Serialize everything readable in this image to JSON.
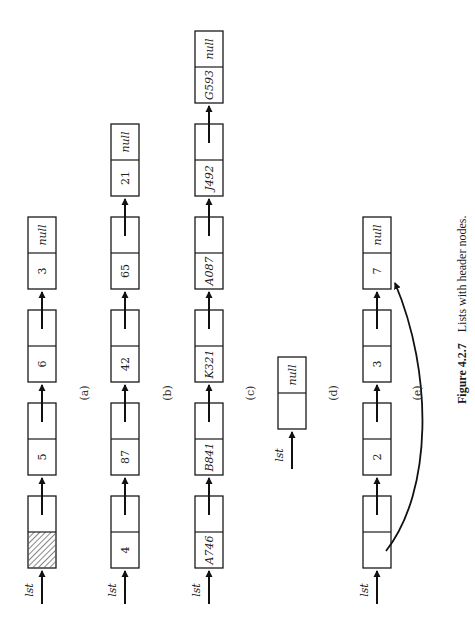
{
  "figure": {
    "caption_number": "Figure 4.2.7",
    "caption_text": "Lists with header nodes.",
    "orientation": "rotated-90-ccw"
  },
  "lists": [
    {
      "id": "a",
      "label": "(a)",
      "pointer_name": "lst",
      "header": "hatched",
      "nodes": [
        {
          "info": "",
          "next": "",
          "hatched": true
        },
        {
          "info": "5",
          "next": ""
        },
        {
          "info": "6",
          "next": ""
        },
        {
          "info": "3",
          "next": "null"
        }
      ]
    },
    {
      "id": "b",
      "label": "(b)",
      "pointer_name": "lst",
      "header": "count",
      "nodes": [
        {
          "info": "4",
          "next": ""
        },
        {
          "info": "87",
          "next": ""
        },
        {
          "info": "42",
          "next": ""
        },
        {
          "info": "65",
          "next": ""
        },
        {
          "info": "21",
          "next": "null"
        }
      ]
    },
    {
      "id": "c",
      "label": "(c)",
      "pointer_name": "lst",
      "header": "last-node-id",
      "nodes": [
        {
          "info": "A746",
          "next": ""
        },
        {
          "info": "B841",
          "next": ""
        },
        {
          "info": "K321",
          "next": ""
        },
        {
          "info": "A087",
          "next": ""
        },
        {
          "info": "J492",
          "next": ""
        },
        {
          "info": "G593",
          "next": "null"
        }
      ]
    },
    {
      "id": "d",
      "label": "(d)",
      "pointer_name": "lst",
      "header": "empty",
      "nodes": [
        {
          "info": "",
          "next": "null"
        }
      ]
    },
    {
      "id": "e",
      "label": "(e)",
      "pointer_name": "lst",
      "header": "pointer-to-last",
      "header_points_to_index": 3,
      "nodes": [
        {
          "info": "",
          "next": ""
        },
        {
          "info": "2",
          "next": ""
        },
        {
          "info": "3",
          "next": ""
        },
        {
          "info": "7",
          "next": "null"
        }
      ]
    }
  ]
}
